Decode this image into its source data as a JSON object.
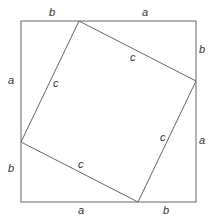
{
  "diagram": {
    "labels": {
      "top_left": "b",
      "top_right": "a",
      "right_top": "b",
      "right_bottom": "a",
      "bottom_left": "a",
      "bottom_right": "b",
      "left_top": "a",
      "left_bottom": "b",
      "hyp_top": "c",
      "hyp_left": "c",
      "hyp_right": "c",
      "hyp_bottom": "c"
    },
    "colors": {
      "line": "#555555",
      "text": "#333333"
    }
  }
}
